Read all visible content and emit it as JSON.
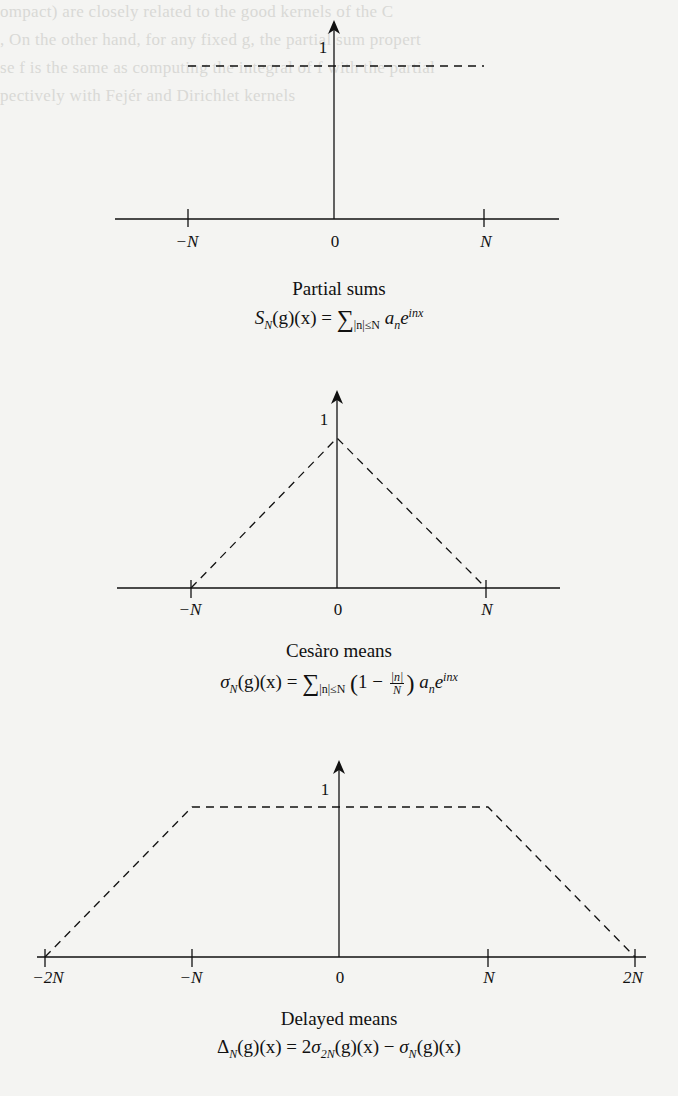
{
  "figures": [
    {
      "id": "partial-sums",
      "caption": "Partial sums",
      "formula": {
        "lhs": "S",
        "lhs_sub": "N",
        "lhs_args": "(g)(x) = ",
        "sum": "∑",
        "sum_sub": "|n|≤N",
        "term": " a",
        "term_sub": "n",
        "exp_base": "e",
        "exp_sup": "inx"
      },
      "y_label": "1",
      "x_ticks": [
        "−N",
        "0",
        "N"
      ],
      "shape": "step (value 1 on [−N, N], 0 elsewhere)"
    },
    {
      "id": "cesaro-means",
      "caption": "Cesàro means",
      "formula": {
        "lhs": "σ",
        "lhs_sub": "N",
        "lhs_args": "(g)(x) = ",
        "sum": "∑",
        "sum_sub": "|n|≤N",
        "paren_open": "(",
        "one_minus": "1 − ",
        "frac_num": "|n|",
        "frac_den": "N",
        "paren_close": ")",
        "term": " a",
        "term_sub": "n",
        "exp_base": "e",
        "exp_sup": "inx"
      },
      "y_label": "1",
      "x_ticks": [
        "−N",
        "0",
        "N"
      ],
      "shape": "triangle (peak 1 at 0, zero at ±N)"
    },
    {
      "id": "delayed-means",
      "caption": "Delayed means",
      "formula": {
        "lhs": "Δ",
        "lhs_sub": "N",
        "lhs_args": "(g)(x) = 2",
        "sigma1": "σ",
        "sigma1_sub": "2N",
        "mid": "(g)(x) − ",
        "sigma2": "σ",
        "sigma2_sub": "N",
        "tail": "(g)(x)"
      },
      "y_label": "1",
      "x_ticks": [
        "−2N",
        "−N",
        "0",
        "N",
        "2N"
      ],
      "shape": "trapezoid (1 on [−N, N], linear to 0 at ±2N)"
    }
  ],
  "bleed_through_lines": [
    "ompact) are closely related to the good kernels of the C",
    ", On the other hand, for any fixed g, the partial sum propert",
    "se f is the same as computing the integral of f with the partial",
    "pectively with Fejér and Dirichlet kernels"
  ]
}
